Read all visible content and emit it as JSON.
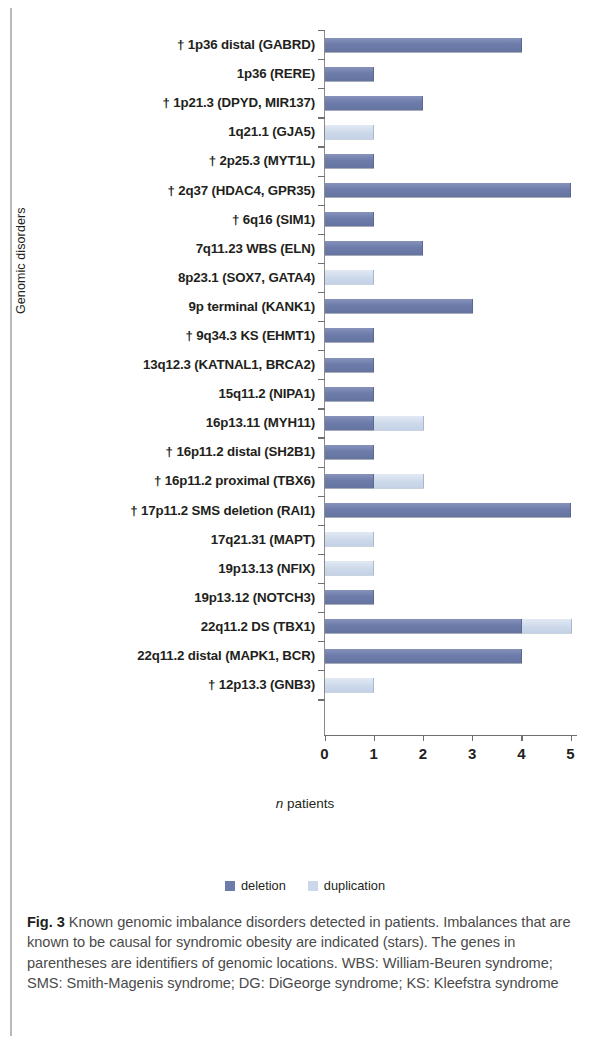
{
  "figure": {
    "label": "Fig. 3",
    "caption": " Known genomic imbalance disorders detected in patients. Imbalances that are known to be causal for syndromic obesity are indicated (stars). The genes in parentheses are identifiers of genomic locations. WBS: William-Beuren syndrome; SMS: Smith-Magenis syndrome; DG: DiGeorge syndrome; KS: Kleefstra syndrome"
  },
  "legend": {
    "deletion_label": "deletion",
    "duplication_label": "duplication",
    "deletion_color": "#6d7cab",
    "duplication_color": "#ccd8ea"
  },
  "axes": {
    "ylabel": "Genomic disorders",
    "xlabel_italic": "n",
    "xlabel_rest": " patients",
    "xticks": [
      "0",
      "1",
      "2",
      "3",
      "4",
      "5"
    ]
  },
  "chart_data": {
    "type": "bar",
    "orientation": "horizontal",
    "stacked": true,
    "title": "Known genomic imbalance disorders detected in patients",
    "xlabel": "n patients",
    "ylabel": "Genomic disorders",
    "xlim": [
      0,
      5
    ],
    "xticks": [
      0,
      1,
      2,
      3,
      4,
      5
    ],
    "grid": false,
    "legend_position": "bottom-center",
    "categories": [
      "† 1p36 distal (GABRD)",
      "1p36 (RERE)",
      "† 1p21.3 (DPYD, MIR137)",
      "1q21.1 (GJA5)",
      "† 2p25.3 (MYT1L)",
      "† 2q37 (HDAC4, GPR35)",
      "† 6q16 (SIM1)",
      "7q11.23 WBS (ELN)",
      "8p23.1 (SOX7, GATA4)",
      "9p terminal (KANK1)",
      "† 9q34.3 KS (EHMT1)",
      "13q12.3 (KATNAL1, BRCA2)",
      "15q11.2 (NIPA1)",
      "16p13.11 (MYH11)",
      "†  16p11.2 distal (SH2B1)",
      "†  16p11.2 proximal (TBX6)",
      "† 17p11.2 SMS deletion (RAI1)",
      "17q21.31 (MAPT)",
      "19p13.13 (NFIX)",
      "19p13.12 (NOTCH3)",
      "22q11.2 DS (TBX1)",
      "22q11.2 distal (MAPK1, BCR)",
      "† 12p13.3 (GNB3)"
    ],
    "series": [
      {
        "name": "deletion",
        "color": "#6d7cab",
        "values": [
          4,
          1,
          2,
          0,
          1,
          5,
          1,
          2,
          0,
          3,
          1,
          1,
          1,
          1,
          1,
          1,
          5,
          0,
          0,
          1,
          4,
          4,
          0
        ]
      },
      {
        "name": "duplication",
        "color": "#ccd8ea",
        "values": [
          0,
          0,
          0,
          1,
          0,
          0,
          0,
          0,
          1,
          0,
          0,
          0,
          0,
          1,
          0,
          1,
          0,
          1,
          1,
          0,
          1,
          0,
          1
        ]
      }
    ]
  }
}
